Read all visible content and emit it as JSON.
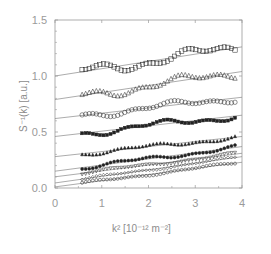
{
  "chart_data": {
    "type": "scatter",
    "title": "",
    "xlabel": "k² [10⁻¹² m⁻²]",
    "ylabel": "S⁻¹(k) [a.u.]",
    "xlim": [
      0,
      4
    ],
    "ylim": [
      0,
      1.5
    ],
    "xticks": [
      "0",
      "1",
      "2",
      "3",
      "4"
    ],
    "yticks": [
      "0.0",
      "0.5",
      "1.0",
      "1.5"
    ],
    "grid": false,
    "legend": null,
    "x_data_range": [
      0.58,
      3.85
    ],
    "series": [
      {
        "name": "series-1",
        "marker": "open-square",
        "fit_intercept": 1.0,
        "fit_at_4": 1.26,
        "wiggle_amp": 0.04
      },
      {
        "name": "series-2",
        "marker": "open-triangle",
        "fit_intercept": 0.79,
        "fit_at_4": 1.04,
        "wiggle_amp": 0.035
      },
      {
        "name": "series-3",
        "marker": "open-circle",
        "fit_intercept": 0.62,
        "fit_at_4": 0.81,
        "wiggle_amp": 0.025
      },
      {
        "name": "series-4",
        "marker": "filled-square",
        "fit_intercept": 0.46,
        "fit_at_4": 0.65,
        "wiggle_amp": 0.025
      },
      {
        "name": "series-5",
        "marker": "filled-triangle",
        "fit_intercept": 0.28,
        "fit_at_4": 0.46,
        "wiggle_amp": 0.015
      },
      {
        "name": "series-6",
        "marker": "filled-circle",
        "fit_intercept": 0.15,
        "fit_at_4": 0.37,
        "wiggle_amp": 0.015
      },
      {
        "name": "series-7",
        "marker": "open-down-triangle",
        "fit_intercept": 0.1,
        "fit_at_4": 0.31,
        "wiggle_amp": 0.01
      },
      {
        "name": "series-8",
        "marker": "open-diamond",
        "fit_intercept": 0.045,
        "fit_at_4": 0.28,
        "wiggle_amp": 0.008
      },
      {
        "name": "series-9",
        "marker": "open-circle-small",
        "fit_intercept": 0.01,
        "fit_at_4": 0.23,
        "wiggle_amp": 0.008
      }
    ]
  },
  "colors": {
    "axis": "#9a9a9a",
    "fit_line": "#888888",
    "marker": "#222222"
  }
}
